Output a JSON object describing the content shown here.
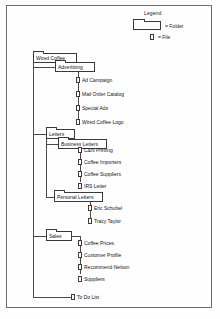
{
  "diagram": {
    "legend": {
      "title": "Legend",
      "folder_label": "= Folder",
      "file_label": "= File",
      "folder_icon": "folder-icon",
      "file_icon": "file-icon"
    },
    "colors": {
      "line": "#4a4a4a",
      "outline": "#3a3a3a",
      "text": "#161616",
      "page_background": "#fefefe",
      "frame": "#6d6d6d"
    },
    "nodes": {
      "root": {
        "label": "Wired Coffee",
        "type": "folder"
      },
      "advertising": {
        "label": "Advertising",
        "type": "folder"
      },
      "letters": {
        "label": "Letters",
        "type": "folder"
      },
      "business_letters": {
        "label": "Business Letters",
        "type": "folder"
      },
      "personal_letters": {
        "label": "Personal Letters",
        "type": "folder"
      },
      "sales": {
        "label": "Sales",
        "type": "folder"
      },
      "todo": {
        "label": "To Do List",
        "type": "file"
      }
    },
    "advertising_files": [
      {
        "label": "Ad Campaign",
        "type": "file"
      },
      {
        "label": "Mail Order Catalog",
        "type": "file"
      },
      {
        "label": "Special Ads",
        "type": "file"
      },
      {
        "label": "Wired Coffee Logo",
        "type": "file"
      }
    ],
    "business_letters_files": [
      {
        "label": "C&N Printing",
        "type": "file"
      },
      {
        "label": "Coffee Importers",
        "type": "file"
      },
      {
        "label": "Coffee Suppliers",
        "type": "file"
      },
      {
        "label": "IRS Letter",
        "type": "file"
      }
    ],
    "personal_letters_files": [
      {
        "label": "Eric Schubel",
        "type": "file"
      },
      {
        "label": "Tracy Taylor",
        "type": "file"
      }
    ],
    "sales_files": [
      {
        "label": "Coffee Prices",
        "type": "file"
      },
      {
        "label": "Customer Profile",
        "type": "file"
      },
      {
        "label": "Recommend Nelson",
        "type": "file"
      },
      {
        "label": "Suppliers",
        "type": "file"
      }
    ]
  }
}
